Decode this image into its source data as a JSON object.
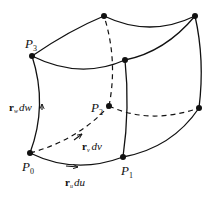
{
  "diagram": {
    "points": {
      "P0": {
        "label": "P",
        "sub": "0"
      },
      "P1": {
        "label": "P",
        "sub": "1"
      },
      "P2": {
        "label": "P",
        "sub": "2"
      },
      "P3": {
        "label": "P",
        "sub": "3"
      }
    },
    "vectors": {
      "du": {
        "vec": "r",
        "sub": "u",
        "diff": "du"
      },
      "dv": {
        "vec": "r",
        "sub": "v",
        "diff": "dv"
      },
      "dw": {
        "vec": "r",
        "sub": "w",
        "diff": "dw"
      }
    },
    "colors": {
      "stroke": "#111111",
      "background": "#ffffff"
    }
  }
}
